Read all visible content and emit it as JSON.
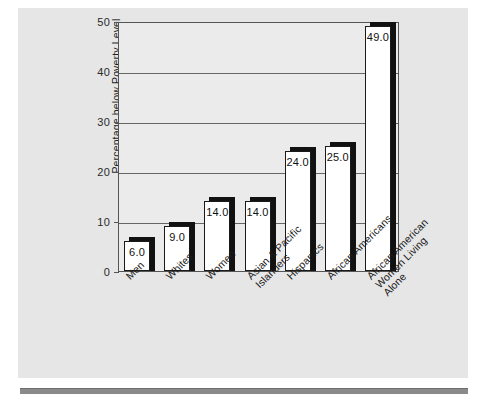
{
  "chart_data": {
    "type": "bar",
    "title": "",
    "subtitle": "",
    "xlabel": "",
    "ylabel": "Percentage below Poverty Level",
    "ylim": [
      0,
      50
    ],
    "ytick_labels": [
      "0",
      "10",
      "20",
      "30",
      "40",
      "50"
    ],
    "ytick_values": [
      0,
      10,
      20,
      30,
      40,
      50
    ],
    "grid": true,
    "grid_axis": "y",
    "legend": "none",
    "categories": [
      "Men",
      "Whites",
      "Women",
      "Asian & Pacific\nIslanders",
      "Hispanics",
      "African Americans",
      "African American\nWomen Living\nAlone"
    ],
    "values": [
      6.0,
      9.0,
      14.0,
      14.0,
      24.0,
      25.0,
      49.0
    ],
    "data_labels": [
      "6.0",
      "9.0",
      "14.0",
      "14.0",
      "24.0",
      "25.0",
      "49.0"
    ],
    "bar_style": {
      "fill": "#ffffff",
      "edge": "#1a1a1a",
      "shadow": "#111111"
    },
    "plot_background": "#ebebeb",
    "figure_background": "#e6e6e6"
  },
  "colors": {
    "page": "#ffffff",
    "panel": "#e6e6e6",
    "plot": "#ebebeb",
    "grid": "#666666",
    "axis": "#555555",
    "text": "#1b1b1b",
    "rule": "#8a8a8a"
  }
}
